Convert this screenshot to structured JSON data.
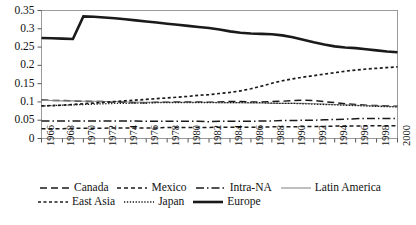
{
  "chart_data": {
    "type": "line",
    "title": "",
    "xlabel": "",
    "ylabel": "",
    "ylim": [
      0,
      0.35
    ],
    "ytick_labels": [
      "0.35",
      "0.3",
      "0.25",
      "0.2",
      "0.15",
      "0.1",
      "0.05",
      "0"
    ],
    "ytick_values": [
      0.35,
      0.3,
      0.25,
      0.2,
      0.15,
      0.1,
      0.05,
      0
    ],
    "grid": false,
    "legend_position": "below-axes",
    "x": [
      1966,
      1967,
      1968,
      1969,
      1970,
      1971,
      1972,
      1973,
      1974,
      1975,
      1976,
      1977,
      1978,
      1979,
      1980,
      1981,
      1982,
      1983,
      1984,
      1985,
      1986,
      1987,
      1988,
      1989,
      1990,
      1991,
      1992,
      1993,
      1994,
      1995,
      1996,
      1997,
      1998,
      1999,
      2000
    ],
    "xtick_labels": [
      "1966",
      "1968",
      "1970",
      "1972",
      "1974",
      "1976",
      "1978",
      "1980",
      "1982",
      "1984",
      "1986",
      "1988",
      "1990",
      "1992",
      "1994",
      "1996",
      "1998",
      "2000"
    ],
    "xtick_values": [
      1966,
      1968,
      1970,
      1972,
      1974,
      1976,
      1978,
      1980,
      1982,
      1984,
      1986,
      1988,
      1990,
      1992,
      1994,
      1996,
      1998,
      2000
    ],
    "series": [
      {
        "name": "Canada",
        "style": "dashed",
        "color": "#1a1a1a",
        "values": [
          0.105,
          0.104,
          0.104,
          0.103,
          0.102,
          0.101,
          0.101,
          0.1,
          0.099,
          0.098,
          0.098,
          0.099,
          0.099,
          0.1,
          0.1,
          0.1,
          0.099,
          0.1,
          0.101,
          0.101,
          0.1,
          0.1,
          0.101,
          0.102,
          0.104,
          0.105,
          0.104,
          0.101,
          0.098,
          0.095,
          0.093,
          0.091,
          0.09,
          0.089,
          0.088
        ]
      },
      {
        "name": "Mexico",
        "style": "dashed-short",
        "color": "#1a1a1a",
        "values": [
          0.027,
          0.027,
          0.027,
          0.028,
          0.028,
          0.028,
          0.028,
          0.029,
          0.029,
          0.029,
          0.029,
          0.029,
          0.03,
          0.03,
          0.03,
          0.03,
          0.03,
          0.031,
          0.031,
          0.031,
          0.031,
          0.031,
          0.032,
          0.032,
          0.032,
          0.033,
          0.033,
          0.033,
          0.034,
          0.034,
          0.034,
          0.035,
          0.035,
          0.035,
          0.035
        ]
      },
      {
        "name": "Intra-NA",
        "style": "dash-dot",
        "color": "#1a1a1a",
        "values": [
          0.048,
          0.048,
          0.048,
          0.048,
          0.048,
          0.048,
          0.048,
          0.048,
          0.048,
          0.048,
          0.047,
          0.047,
          0.047,
          0.047,
          0.047,
          0.047,
          0.046,
          0.047,
          0.047,
          0.047,
          0.047,
          0.048,
          0.048,
          0.049,
          0.049,
          0.05,
          0.05,
          0.051,
          0.052,
          0.053,
          0.054,
          0.055,
          0.055,
          0.055,
          0.055
        ]
      },
      {
        "name": "Latin America",
        "style": "solid-thin",
        "color": "#8a8a8a",
        "values": [
          0.104,
          0.104,
          0.103,
          0.103,
          0.102,
          0.102,
          0.101,
          0.101,
          0.1,
          0.1,
          0.099,
          0.099,
          0.099,
          0.099,
          0.099,
          0.099,
          0.099,
          0.098,
          0.098,
          0.098,
          0.097,
          0.097,
          0.096,
          0.096,
          0.096,
          0.096,
          0.095,
          0.094,
          0.093,
          0.092,
          0.091,
          0.09,
          0.089,
          0.088,
          0.087
        ]
      },
      {
        "name": "East Asia",
        "style": "dotted-dash",
        "color": "#1a1a1a",
        "values": [
          0.089,
          0.09,
          0.091,
          0.093,
          0.095,
          0.097,
          0.099,
          0.101,
          0.103,
          0.105,
          0.107,
          0.109,
          0.111,
          0.113,
          0.115,
          0.118,
          0.12,
          0.123,
          0.126,
          0.13,
          0.136,
          0.143,
          0.151,
          0.158,
          0.163,
          0.168,
          0.172,
          0.176,
          0.18,
          0.184,
          0.187,
          0.19,
          0.192,
          0.194,
          0.196
        ]
      },
      {
        "name": "Japan",
        "style": "dotted",
        "color": "#1a1a1a",
        "values": [
          0.089,
          0.09,
          0.091,
          0.092,
          0.093,
          0.094,
          0.095,
          0.096,
          0.096,
          0.097,
          0.097,
          0.098,
          0.098,
          0.098,
          0.098,
          0.098,
          0.098,
          0.098,
          0.098,
          0.098,
          0.098,
          0.098,
          0.097,
          0.096,
          0.096,
          0.095,
          0.094,
          0.093,
          0.092,
          0.091,
          0.09,
          0.089,
          0.088,
          0.087,
          0.086
        ]
      },
      {
        "name": "Europe",
        "style": "solid-thick",
        "color": "#1a1a1a",
        "values": [
          0.275,
          0.274,
          0.273,
          0.272,
          0.334,
          0.333,
          0.331,
          0.329,
          0.326,
          0.323,
          0.32,
          0.317,
          0.314,
          0.311,
          0.308,
          0.305,
          0.302,
          0.298,
          0.293,
          0.289,
          0.287,
          0.286,
          0.285,
          0.282,
          0.277,
          0.27,
          0.263,
          0.257,
          0.252,
          0.249,
          0.247,
          0.244,
          0.241,
          0.238,
          0.236
        ]
      }
    ]
  },
  "legend": {
    "rows": [
      [
        {
          "label": "Canada",
          "style": "dashed"
        },
        {
          "label": "Mexico",
          "style": "dashed-short"
        },
        {
          "label": "Intra-NA",
          "style": "dash-dot"
        },
        {
          "label": "Latin America",
          "style": "solid-thin"
        }
      ],
      [
        {
          "label": "East Asia",
          "style": "dotted-dash"
        },
        {
          "label": "Japan",
          "style": "dotted"
        },
        {
          "label": "Europe",
          "style": "solid-thick"
        }
      ]
    ]
  }
}
